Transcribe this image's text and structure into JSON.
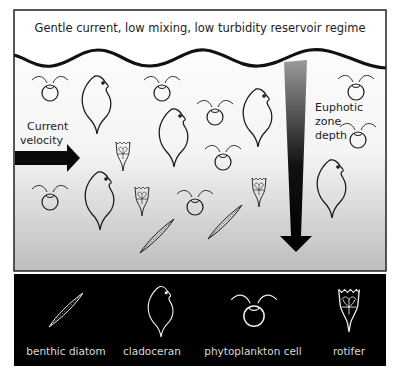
{
  "diagram": {
    "title": "Gentle current, low mixing, low turbidity reservoir regime",
    "current_label": [
      "Current",
      "velocity"
    ],
    "euphotic_label": [
      "Euphotic",
      "zone",
      "depth"
    ],
    "colors": {
      "frame": "#222222",
      "ink": "#1a1a1a",
      "legend_bg": "#000000",
      "legend_ink": "#eeeeee",
      "water_top": "#ffffff",
      "water_bottom": "#bdbdbd"
    }
  },
  "legend": {
    "items": [
      {
        "key": "diatom",
        "label": "benthic diatom"
      },
      {
        "key": "cladoceran",
        "label": "cladoceran"
      },
      {
        "key": "phyto",
        "label": "phytoplankton cell"
      },
      {
        "key": "rotifer",
        "label": "rotifer"
      }
    ]
  },
  "organisms": {
    "counts": {
      "phytoplankton": 10,
      "cladoceran": 6,
      "rotifer": 4,
      "diatom": 2
    }
  }
}
